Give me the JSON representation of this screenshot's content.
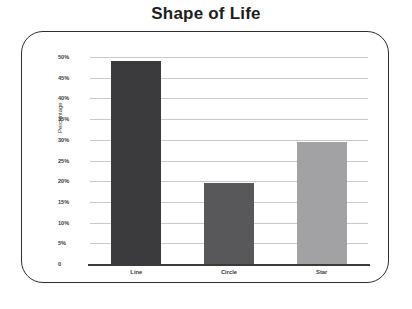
{
  "title": "Shape of Life",
  "axis": {
    "y_title": "Percentage",
    "y_ticks": [
      "50%",
      "45%",
      "40%",
      "35%",
      "30%",
      "25%",
      "20%",
      "15%",
      "10%",
      "5%",
      "0"
    ]
  },
  "chart_data": {
    "type": "bar",
    "title": "Shape of Life",
    "xlabel": "",
    "ylabel": "Percentage",
    "categories": [
      "Line",
      "Circle",
      "Star"
    ],
    "values": [
      49,
      19.5,
      29.5
    ],
    "ylim": [
      0,
      50
    ],
    "ytick_values": [
      0,
      5,
      10,
      15,
      20,
      25,
      30,
      35,
      40,
      45,
      50
    ],
    "ytick_labels": [
      "0",
      "5%",
      "10%",
      "15%",
      "20%",
      "25%",
      "30%",
      "35%",
      "40%",
      "45%",
      "50%"
    ],
    "grid": true,
    "legend": "none",
    "bar_colors": [
      "#3b3b3d",
      "#58585a",
      "#a2a2a4"
    ]
  },
  "style": {
    "frame_border": "#2e2e30",
    "gridline": "#c9c9cb",
    "axis_line": "#3a3a3c",
    "text": "#3a3a3c",
    "title_color": "#1d1d1f",
    "background": "#ffffff"
  }
}
